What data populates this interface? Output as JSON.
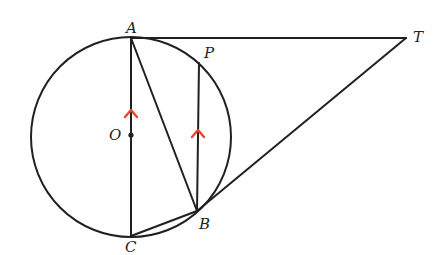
{
  "diagram": {
    "colors": {
      "stroke": "#231f20",
      "arrow": "#e8452c",
      "background": "#ffffff"
    },
    "circle": {
      "center": "O",
      "cx": 131,
      "cy": 137,
      "r": 100
    },
    "points": {
      "A": {
        "label": "A",
        "x": 131,
        "y": 38
      },
      "T": {
        "label": "T",
        "x": 406,
        "y": 38
      },
      "P": {
        "label": "P",
        "x": 199,
        "y": 63
      },
      "O": {
        "label": "O",
        "x": 131,
        "y": 135
      },
      "B": {
        "label": "B",
        "x": 197,
        "y": 211
      },
      "C": {
        "label": "C",
        "x": 131,
        "y": 236
      }
    },
    "segments": [
      {
        "from": "A",
        "to": "T",
        "note": "tangent at A"
      },
      {
        "from": "T",
        "to": "B",
        "note": "tangent at B"
      },
      {
        "from": "A",
        "to": "C",
        "note": "diameter"
      },
      {
        "from": "A",
        "to": "B"
      },
      {
        "from": "P",
        "to": "B"
      },
      {
        "from": "C",
        "to": "B"
      }
    ],
    "parallel_marks": [
      {
        "on": "AC",
        "icon": "parallel-arrow-icon"
      },
      {
        "on": "PB",
        "icon": "parallel-arrow-icon"
      }
    ]
  }
}
